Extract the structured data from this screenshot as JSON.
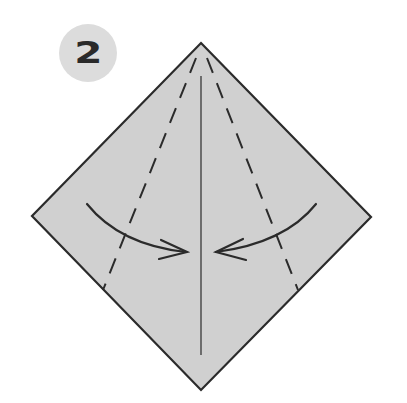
{
  "step": {
    "number": "2"
  },
  "diagram": {
    "shape": "square-on-diagonal",
    "paper_color": "#d0d0d0",
    "outline_color": "#2b2b2b",
    "vertices": {
      "top": [
        201,
        43
      ],
      "right": [
        371,
        217
      ],
      "bottom": [
        201,
        390
      ],
      "left": [
        32,
        216
      ]
    },
    "center_crease": {
      "from": [
        201,
        76
      ],
      "to": [
        201,
        355
      ]
    },
    "valley_folds": [
      {
        "name": "left",
        "from": [
          196,
          60
        ],
        "to": [
          103,
          290
        ]
      },
      {
        "name": "right",
        "from": [
          207,
          60
        ],
        "to": [
          298,
          290
        ]
      }
    ],
    "arrows": [
      {
        "name": "left-fold-arrow",
        "direction": "right"
      },
      {
        "name": "right-fold-arrow",
        "direction": "left"
      }
    ]
  }
}
